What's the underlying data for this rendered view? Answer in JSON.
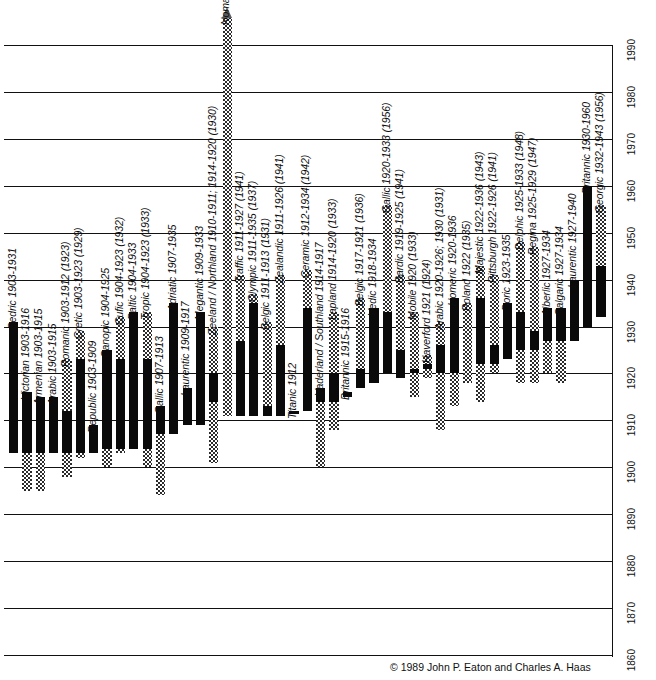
{
  "chart_data": {
    "type": "bar",
    "title": "",
    "subtitle": "",
    "xlabel": "",
    "ylabel": "",
    "ylim": [
      1860,
      1996
    ],
    "grid": true,
    "legend_position": "none",
    "orientation": "vertical",
    "yticks": [
      1860,
      1870,
      1880,
      1890,
      1900,
      1910,
      1920,
      1930,
      1940,
      1950,
      1960,
      1970,
      1980,
      1990
    ],
    "ytick_labels": [
      "1860",
      "1870",
      "1880",
      "1890",
      "1900",
      "1910",
      "1920",
      "1930",
      "1940",
      "1950",
      "1960",
      "1970",
      "1980",
      "1990"
    ],
    "series_note": "Each bar: lower hatched segment = pre-1903 service, solid black segment = main career span, upper hatched segment = later / extended service under other names.",
    "categories": [
      "Cedric",
      "Victorian",
      "Armenian",
      "Arabic",
      "Romanic",
      "Cretic",
      "Republic",
      "Canopic",
      "Cufic",
      "Baltic",
      "Tropic",
      "Gallic",
      "Adriatic",
      "Laurentic",
      "Megantic",
      "Zeeland / Northland",
      "Nomadic",
      "Traffic",
      "Olympic",
      "Belgic",
      "Zealandic",
      "Titanic",
      "Ceramic",
      "Vaderland / Southland",
      "Lapland",
      "Britannic",
      "Belgic",
      "Vedic",
      "Gallic",
      "Bardic",
      "Mobile",
      "Haverford",
      "Arabic",
      "Homeric",
      "Poland",
      "Majestic",
      "Pittsburgh",
      "Doric",
      "Delphic",
      "Regina",
      "Alberlic",
      "Calgaric",
      "Laurentic",
      "Britannic",
      "Georgic"
    ],
    "bars": [
      {
        "name": "Cedric",
        "label": "Cedric  1903-1931",
        "start": 1903,
        "end": 1931,
        "solid": [
          1903,
          1931
        ],
        "hatch_low": null,
        "hatch_high": null
      },
      {
        "name": "Victorian",
        "label": "Victorian 1903-1916",
        "start": 1895,
        "end": 1916,
        "solid": [
          1903,
          1916
        ],
        "hatch_low": [
          1895,
          1903
        ],
        "hatch_high": null
      },
      {
        "name": "Armenian",
        "label": "Armenian 1903-1915",
        "start": 1895,
        "end": 1915,
        "solid": [
          1903,
          1915
        ],
        "hatch_low": [
          1895,
          1903
        ],
        "hatch_high": null
      },
      {
        "name": "Arabic",
        "label": "Arabic 1903-1915",
        "start": 1903,
        "end": 1915,
        "solid": [
          1903,
          1915
        ],
        "hatch_low": null,
        "hatch_high": null
      },
      {
        "name": "Romanic",
        "label": "Romanic 1903-1912 (1923)",
        "start": 1898,
        "end": 1923,
        "solid": [
          1903,
          1912
        ],
        "hatch_low": [
          1898,
          1903
        ],
        "hatch_high": [
          1912,
          1923
        ]
      },
      {
        "name": "Cretic",
        "label": "Cretic  1903-1923 (1929)",
        "start": 1902,
        "end": 1929,
        "solid": [
          1903,
          1923
        ],
        "hatch_low": [
          1902,
          1903
        ],
        "hatch_high": [
          1923,
          1929
        ]
      },
      {
        "name": "Republic",
        "label": "Republic 1903-1909",
        "start": 1903,
        "end": 1909,
        "solid": [
          1903,
          1909
        ],
        "hatch_low": null,
        "hatch_high": null
      },
      {
        "name": "Canopic",
        "label": "Canopic 1904-1925",
        "start": 1900,
        "end": 1925,
        "solid": [
          1904,
          1925
        ],
        "hatch_low": [
          1900,
          1904
        ],
        "hatch_high": null
      },
      {
        "name": "Cufic",
        "label": "Cufic 1904-1923 (1932)",
        "start": 1903,
        "end": 1932,
        "solid": [
          1904,
          1923
        ],
        "hatch_low": [
          1903,
          1904
        ],
        "hatch_high": [
          1923,
          1932
        ]
      },
      {
        "name": "Baltic",
        "label": "Baltic 1904-1933",
        "start": 1904,
        "end": 1933,
        "solid": [
          1904,
          1933
        ],
        "hatch_low": null,
        "hatch_high": null
      },
      {
        "name": "Tropic",
        "label": "Tropic 1904-1923 (1933)",
        "start": 1900,
        "end": 1933,
        "solid": [
          1904,
          1923
        ],
        "hatch_low": [
          1900,
          1904
        ],
        "hatch_high": [
          1923,
          1933
        ]
      },
      {
        "name": "Gallic",
        "label": "Gallic 1907-1913",
        "start": 1894,
        "end": 1913,
        "solid": [
          1907,
          1913
        ],
        "hatch_low": [
          1894,
          1907
        ],
        "hatch_high": null
      },
      {
        "name": "Adriatic",
        "label": "Adriatic 1907-1935",
        "start": 1907,
        "end": 1935,
        "solid": [
          1907,
          1935
        ],
        "hatch_low": null,
        "hatch_high": null
      },
      {
        "name": "Laurentic",
        "label": "Laurentic 1909-1917",
        "start": 1909,
        "end": 1917,
        "solid": [
          1909,
          1917
        ],
        "hatch_low": null,
        "hatch_high": null
      },
      {
        "name": "Megantic",
        "label": "Megantic  1909-1933",
        "start": 1909,
        "end": 1933,
        "solid": [
          1909,
          1933
        ],
        "hatch_low": null,
        "hatch_high": null
      },
      {
        "name": "Zeeland / Northland",
        "label": "Zeeland / Northland  1910-1911; 1914-1920 (1930)",
        "start": 1901,
        "end": 1930,
        "solid": [
          1914,
          1920
        ],
        "hatch_low": [
          1901,
          1914
        ],
        "hatch_high": [
          1920,
          1930
        ]
      },
      {
        "name": "Nomadic",
        "label": "Nomadic 1911-1927 (1989+)",
        "start": 1911,
        "end": 1996,
        "solid": null,
        "hatch_low": null,
        "hatch_high": [
          1911,
          1996
        ],
        "arrow": true
      },
      {
        "name": "Traffic",
        "label": "Traffic 1911-1927 (1941)",
        "start": 1911,
        "end": 1941,
        "solid": [
          1911,
          1927
        ],
        "hatch_low": null,
        "hatch_high": [
          1927,
          1941
        ]
      },
      {
        "name": "Olympic",
        "label": "Olympic 1911-1935 (1937)",
        "start": 1911,
        "end": 1937,
        "solid": [
          1911,
          1935
        ],
        "hatch_low": null,
        "hatch_high": [
          1935,
          1937
        ]
      },
      {
        "name": "Belgic",
        "label": "Belgic 1911-1913 (1931)",
        "start": 1911,
        "end": 1931,
        "solid": [
          1911,
          1913
        ],
        "hatch_low": null,
        "hatch_high": [
          1913,
          1931
        ]
      },
      {
        "name": "Zealandic",
        "label": "Zealandic  1911-1926 (1941)",
        "start": 1911,
        "end": 1941,
        "solid": [
          1911,
          1926
        ],
        "hatch_low": null,
        "hatch_high": [
          1926,
          1941
        ]
      },
      {
        "name": "Titanic",
        "label": "Titanic 1912",
        "start": 1912,
        "end": 1912,
        "solid": [
          1912,
          1912
        ],
        "hatch_low": null,
        "hatch_high": null
      },
      {
        "name": "Ceramic",
        "label": "Ceramic  1912-1934 (1942)",
        "start": 1912,
        "end": 1942,
        "solid": [
          1912,
          1934
        ],
        "hatch_low": null,
        "hatch_high": [
          1934,
          1942
        ]
      },
      {
        "name": "Vaderland / Southland",
        "label": "Vaderland / Southland  1914-1917",
        "start": 1900,
        "end": 1917,
        "solid": [
          1914,
          1917
        ],
        "hatch_low": [
          1900,
          1914
        ],
        "hatch_high": null
      },
      {
        "name": "Lapland",
        "label": "Lapland  1914-1920 (1933)",
        "start": 1908,
        "end": 1933,
        "solid": [
          1914,
          1920
        ],
        "hatch_low": [
          1908,
          1914
        ],
        "hatch_high": [
          1920,
          1933
        ]
      },
      {
        "name": "Britannic",
        "label": "Britannic 1915-1916",
        "start": 1915,
        "end": 1916,
        "solid": [
          1915,
          1916
        ],
        "hatch_low": null,
        "hatch_high": null
      },
      {
        "name": "Belgic",
        "label": "Belgic  1917-1921 (1936)",
        "start": 1917,
        "end": 1936,
        "solid": [
          1917,
          1921
        ],
        "hatch_low": null,
        "hatch_high": [
          1921,
          1936
        ]
      },
      {
        "name": "Vedic",
        "label": "Vedic 1918-1934",
        "start": 1918,
        "end": 1934,
        "solid": [
          1918,
          1934
        ],
        "hatch_low": null,
        "hatch_high": null
      },
      {
        "name": "Gallic",
        "label": "Gallic  1920-1933 (1956)",
        "start": 1920,
        "end": 1956,
        "solid": [
          1920,
          1933
        ],
        "hatch_low": null,
        "hatch_high": [
          1933,
          1956
        ]
      },
      {
        "name": "Bardic",
        "label": "Bardic 1919-1925 (1941)",
        "start": 1919,
        "end": 1941,
        "solid": [
          1919,
          1925
        ],
        "hatch_low": null,
        "hatch_high": [
          1925,
          1941
        ]
      },
      {
        "name": "Mobile",
        "label": "Mobile 1920 (1933)",
        "start": 1915,
        "end": 1933,
        "solid": [
          1920,
          1921
        ],
        "hatch_low": [
          1915,
          1920
        ],
        "hatch_high": [
          1921,
          1933
        ]
      },
      {
        "name": "Haverford",
        "label": "Haverford 1921 (1924)",
        "start": 1919,
        "end": 1924,
        "solid": [
          1921,
          1922
        ],
        "hatch_low": [
          1919,
          1921
        ],
        "hatch_high": [
          1922,
          1924
        ]
      },
      {
        "name": "Arabic",
        "label": "Arabic 1920-1926; 1930 (1931)",
        "start": 1908,
        "end": 1931,
        "solid": [
          1920,
          1926
        ],
        "hatch_low": [
          1908,
          1920
        ],
        "hatch_high": [
          1926,
          1931
        ]
      },
      {
        "name": "Homeric",
        "label": "Homeric 1920-1936",
        "start": 1913,
        "end": 1936,
        "solid": [
          1920,
          1936
        ],
        "hatch_low": [
          1913,
          1920
        ],
        "hatch_high": null
      },
      {
        "name": "Poland",
        "label": "Poland 1922 (1935)",
        "start": 1918,
        "end": 1935,
        "solid": null,
        "hatch_low": [
          1918,
          1935
        ],
        "hatch_high": null
      },
      {
        "name": "Majestic",
        "label": "Majestic 1922-1936 (1943)",
        "start": 1914,
        "end": 1943,
        "solid": [
          1922,
          1936
        ],
        "hatch_low": [
          1914,
          1922
        ],
        "hatch_high": [
          1936,
          1943
        ]
      },
      {
        "name": "Pittsburgh",
        "label": "Pittsburgh 1922-1926 (1941)",
        "start": 1920,
        "end": 1941,
        "solid": [
          1922,
          1926
        ],
        "hatch_low": [
          1920,
          1922
        ],
        "hatch_high": [
          1926,
          1941
        ]
      },
      {
        "name": "Doric",
        "label": "Doric 1923-1935",
        "start": 1923,
        "end": 1935,
        "solid": [
          1923,
          1935
        ],
        "hatch_low": null,
        "hatch_high": null
      },
      {
        "name": "Delphic",
        "label": "Delphic  1925-1933 (1948)",
        "start": 1918,
        "end": 1948,
        "solid": [
          1925,
          1933
        ],
        "hatch_low": [
          1918,
          1925
        ],
        "hatch_high": [
          1933,
          1948
        ]
      },
      {
        "name": "Regina",
        "label": "Regina 1925-1929 (1947)",
        "start": 1918,
        "end": 1947,
        "solid": [
          1925,
          1929
        ],
        "hatch_low": [
          1918,
          1925
        ],
        "hatch_high": [
          1929,
          1947
        ]
      },
      {
        "name": "Alberlic",
        "label": "Alberlic 1927-1934",
        "start": 1920,
        "end": 1934,
        "solid": [
          1927,
          1934
        ],
        "hatch_low": [
          1920,
          1927
        ],
        "hatch_high": null
      },
      {
        "name": "Calgaric",
        "label": "Calgaric 1927-1934",
        "start": 1918,
        "end": 1934,
        "solid": [
          1927,
          1934
        ],
        "hatch_low": [
          1918,
          1927
        ],
        "hatch_high": null
      },
      {
        "name": "Laurentic",
        "label": "Laurentic 1927-1940",
        "start": 1927,
        "end": 1940,
        "solid": [
          1927,
          1940
        ],
        "hatch_low": null,
        "hatch_high": null
      },
      {
        "name": "Britannic",
        "label": "Britannic  1930-1960",
        "start": 1930,
        "end": 1960,
        "solid": [
          1930,
          1960
        ],
        "hatch_low": null,
        "hatch_high": null
      },
      {
        "name": "Georgic",
        "label": "Georgic 1932-1943 (1956)",
        "start": 1932,
        "end": 1956,
        "solid": [
          1932,
          1943
        ],
        "hatch_low": null,
        "hatch_high": [
          1943,
          1956
        ]
      }
    ]
  },
  "credit": {
    "symbol": "©",
    "text": "1989 John P. Eaton and Charles A. Haas"
  }
}
